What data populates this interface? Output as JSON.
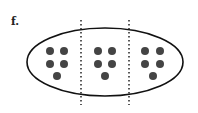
{
  "figure": {
    "label": "f.",
    "ellipse": {
      "cx": 105,
      "cy": 62,
      "rx": 78,
      "ry": 34,
      "stroke": "#111111"
    },
    "dividers": [
      {
        "x": 81,
        "y1": 20,
        "y2": 105
      },
      {
        "x": 129,
        "y1": 20,
        "y2": 105
      }
    ],
    "groups": [
      {
        "name": "group-1",
        "dots": [
          [
            50,
            51
          ],
          [
            64,
            51
          ],
          [
            50,
            64
          ],
          [
            64,
            64
          ],
          [
            57,
            76
          ]
        ]
      },
      {
        "name": "group-2",
        "dots": [
          [
            98,
            51
          ],
          [
            112,
            51
          ],
          [
            98,
            64
          ],
          [
            112,
            64
          ],
          [
            105,
            76
          ]
        ]
      },
      {
        "name": "group-3",
        "dots": [
          [
            145,
            51
          ],
          [
            160,
            51
          ],
          [
            145,
            64
          ],
          [
            160,
            64
          ],
          [
            153,
            76
          ]
        ]
      }
    ],
    "dot_radius": 4,
    "dot_color": "#444444",
    "dots_per_group": 5,
    "group_count": 3
  }
}
